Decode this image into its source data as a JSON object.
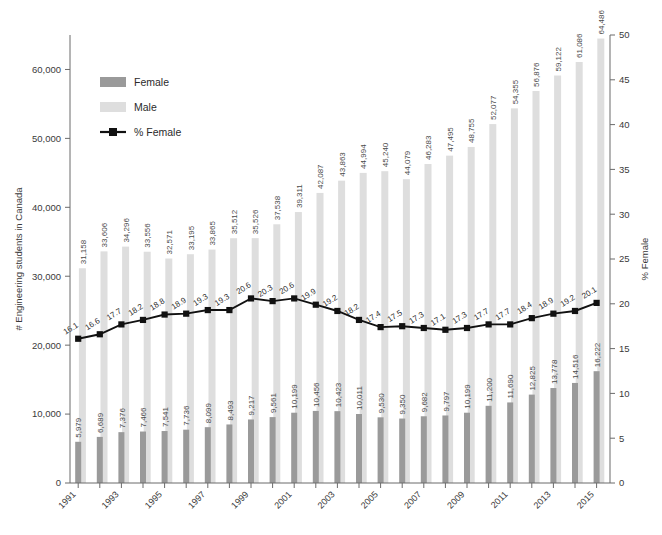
{
  "chart_data": {
    "type": "bar",
    "title": "",
    "subtitle": "",
    "xlabel": "",
    "ylabel": "# Engineering students in Canada",
    "y2label": "% Female",
    "grid": false,
    "legend_position": "upper-left-inside",
    "ylim": [
      0,
      65000
    ],
    "y2lim": [
      0,
      50
    ],
    "yticks": [
      0,
      10000,
      20000,
      30000,
      40000,
      50000,
      60000
    ],
    "ytick_labels": [
      "0",
      "10,000",
      "20,000",
      "30,000",
      "40,000",
      "50,000",
      "60,000"
    ],
    "y2ticks": [
      0,
      5,
      10,
      15,
      20,
      25,
      30,
      35,
      40,
      45,
      50
    ],
    "y2tick_labels": [
      "0",
      "5",
      "10",
      "15",
      "20",
      "25",
      "30",
      "35",
      "40",
      "45",
      "50"
    ],
    "categories": [
      "1991",
      "1992",
      "1993",
      "1994",
      "1995",
      "1996",
      "1997",
      "1998",
      "1999",
      "2000",
      "2001",
      "2002",
      "2003",
      "2004",
      "2005",
      "2006",
      "2007",
      "2008",
      "2009",
      "2010",
      "2011",
      "2012",
      "2013",
      "2014",
      "2015"
    ],
    "xtick_labels_shown": [
      "1991",
      "",
      "1993",
      "",
      "1995",
      "",
      "1997",
      "",
      "1999",
      "",
      "2001",
      "",
      "2003",
      "",
      "2005",
      "",
      "2007",
      "",
      "2009",
      "",
      "2011",
      "",
      "2013",
      "",
      "2015"
    ],
    "series": [
      {
        "name": "Female",
        "type": "bar",
        "color": "#9a9a9a",
        "axis": "left",
        "values": [
          5979,
          6689,
          7376,
          7466,
          7541,
          7736,
          8099,
          8493,
          9217,
          9561,
          10199,
          10456,
          10423,
          10011,
          9530,
          9350,
          9682,
          9797,
          10199,
          11200,
          11690,
          12825,
          13778,
          14516,
          16222
        ],
        "labels": [
          "5,979",
          "6,689",
          "7,376",
          "7,466",
          "7,541",
          "7,736",
          "8,099",
          "8,493",
          "9,217",
          "9,561",
          "10,199",
          "10,456",
          "10,423",
          "10,011",
          "9,530",
          "9,350",
          "9,682",
          "9,797",
          "10,199",
          "11,200",
          "11,690",
          "12,825",
          "13,778",
          "14,516",
          "16,222"
        ]
      },
      {
        "name": "Male",
        "type": "bar",
        "color": "#dedede",
        "axis": "left",
        "values": [
          31158,
          33606,
          34296,
          33556,
          32571,
          33195,
          33865,
          35512,
          35526,
          37538,
          39311,
          42087,
          43863,
          44994,
          45240,
          44079,
          46283,
          47495,
          48755,
          52077,
          54355,
          56876,
          59122,
          61086,
          64486
        ],
        "labels": [
          "31,158",
          "33,606",
          "34,296",
          "33,556",
          "32,571",
          "33,195",
          "33,865",
          "35,512",
          "35,526",
          "37,538",
          "39,311",
          "42,087",
          "43,863",
          "44,994",
          "45,240",
          "44,079",
          "46,283",
          "47,495",
          "48,755",
          "52,077",
          "54,355",
          "56,876",
          "59,122",
          "61,086",
          "64,486"
        ]
      },
      {
        "name": "% Female",
        "type": "line",
        "color": "#111111",
        "axis": "right",
        "values": [
          16.1,
          16.6,
          17.7,
          18.2,
          18.8,
          18.9,
          19.3,
          19.3,
          20.6,
          20.3,
          20.6,
          19.9,
          19.2,
          18.2,
          17.4,
          17.5,
          17.3,
          17.1,
          17.3,
          17.7,
          17.7,
          18.4,
          18.9,
          19.2,
          20.1
        ],
        "labels": [
          "16.1",
          "16.6",
          "17.7",
          "18.2",
          "18.8",
          "18.9",
          "19.3",
          "19.3",
          "20.6",
          "20.3",
          "20.6",
          "19.9",
          "19.2",
          "18.2",
          "17.4",
          "17.5",
          "17.3",
          "17.1",
          "17.3",
          "17.7",
          "17.7",
          "18.4",
          "18.9",
          "19.2",
          "20.1"
        ]
      }
    ]
  },
  "legend": {
    "items": [
      {
        "label": "Female",
        "kind": "swatch",
        "color": "#9a9a9a"
      },
      {
        "label": "Male",
        "kind": "swatch",
        "color": "#dedede"
      },
      {
        "label": "% Female",
        "kind": "line-marker",
        "color": "#111111"
      }
    ]
  },
  "colors": {
    "female_bar": "#9a9a9a",
    "male_bar": "#dedede",
    "line": "#111111",
    "axis": "#6b6b6b",
    "text": "#3a3a3a",
    "background": "#ffffff"
  }
}
